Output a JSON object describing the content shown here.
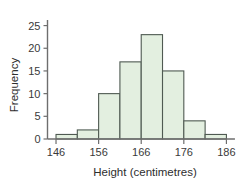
{
  "chart_data": {
    "type": "bar",
    "title": "",
    "subtitle": "",
    "xlabel": "Height (centimetres)",
    "ylabel": "Frequency",
    "categories": [
      "146-151",
      "151-156",
      "156-161",
      "161-166",
      "166-171",
      "171-176",
      "176-181",
      "181-186"
    ],
    "bin_edges": [
      146,
      151,
      156,
      161,
      166,
      171,
      176,
      181,
      186
    ],
    "values": [
      1,
      2,
      10,
      17,
      23,
      15,
      4,
      1
    ],
    "xlim": [
      144,
      188
    ],
    "ylim": [
      0,
      27
    ],
    "xticks": [
      146,
      156,
      166,
      176,
      186
    ],
    "xtick_labels": [
      "146",
      "156",
      "166",
      "176",
      "186"
    ],
    "yticks": [
      0,
      5,
      10,
      15,
      20,
      25
    ],
    "ytick_labels": [
      "0",
      "5",
      "10",
      "15",
      "20",
      "25"
    ],
    "grid": false,
    "legend": false,
    "legend_position": "none",
    "bar_fill_color": "#e3efe0",
    "bar_edge_color": "#4f5a52",
    "axis_color": "#6e6e6e",
    "text_color": "#3a3a3a",
    "background_color": "#ffffff"
  },
  "axes": {
    "y_axis_title": "Frequency",
    "x_axis_title": "Height (centimetres)"
  }
}
